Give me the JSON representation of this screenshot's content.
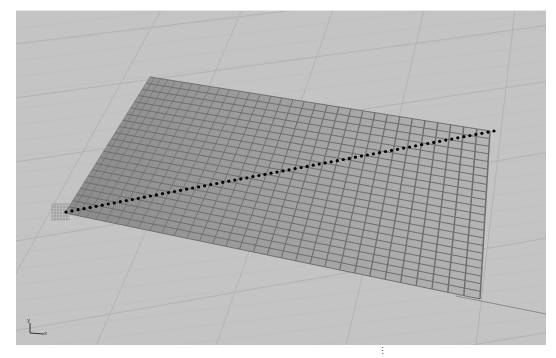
{
  "viewport": {
    "name": "Perspective",
    "background": "#c4c4c4",
    "ground_grid_color": "#b3b3b3",
    "ground_grid_major_color": "#a6a6a6",
    "mesh": {
      "corners": {
        "top_left": [
          134,
          66
        ],
        "top_right": [
          474,
          120
        ],
        "bottom_right": [
          464,
          288
        ],
        "bottom_left": [
          49,
          202
        ]
      },
      "divisions_u": 32,
      "divisions_v": 22,
      "line_color": "#6e6e6e",
      "fill_near": "#8a8a8a",
      "fill_far": "#b5b5b5"
    },
    "polyline": {
      "start": [
        50,
        201
      ],
      "end": [
        478,
        120
      ],
      "dot_count": 72,
      "dot_color": "#000000"
    },
    "axis_widget": {
      "x_label": "x",
      "y_label": "y"
    }
  },
  "statusbar": {
    "grip_glyph": "⋮"
  }
}
